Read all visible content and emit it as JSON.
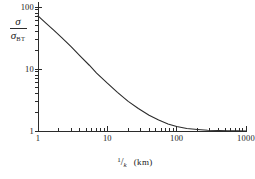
{
  "chart_data": {
    "type": "line",
    "title": "",
    "subtitle": "",
    "xlabel": "1/k  (km)",
    "ylabel": "σ/σ_BT",
    "xscale": "log",
    "yscale": "log",
    "xlim": [
      1,
      1000
    ],
    "ylim": [
      1,
      100
    ],
    "grid": false,
    "legend": null,
    "x_ticks": [
      {
        "value": 1,
        "label": "1",
        "major": true
      },
      {
        "value": 10,
        "label": "10",
        "major": true
      },
      {
        "value": 100,
        "label": "100",
        "major": true
      },
      {
        "value": 1000,
        "label": "1000",
        "major": true
      }
    ],
    "x_minor_ticks": [
      2,
      3,
      4,
      5,
      6,
      7,
      8,
      9,
      20,
      30,
      40,
      50,
      60,
      70,
      80,
      90,
      200,
      300,
      400,
      500,
      600,
      700,
      800,
      900
    ],
    "y_ticks": [
      {
        "value": 1,
        "label": "1",
        "major": true
      },
      {
        "value": 10,
        "label": "10",
        "major": true
      },
      {
        "value": 100,
        "label": "100",
        "major": true
      }
    ],
    "y_minor_ticks": [
      2,
      3,
      4,
      5,
      6,
      7,
      8,
      9,
      20,
      30,
      40,
      50,
      60,
      70,
      80,
      90
    ],
    "series": [
      {
        "name": "sigma ratio",
        "color": "#2b2b2b",
        "x": [
          1,
          1.3,
          1.7,
          2.2,
          3,
          4,
          5.5,
          7,
          10,
          14,
          20,
          28,
          40,
          55,
          75,
          100,
          140,
          200,
          280,
          400,
          550,
          750,
          1000
        ],
        "y": [
          72,
          55,
          42,
          32,
          23,
          16.5,
          11.5,
          8.6,
          5.9,
          4.2,
          3.0,
          2.3,
          1.8,
          1.5,
          1.3,
          1.18,
          1.1,
          1.06,
          1.03,
          1.02,
          1.01,
          1.005,
          1.0
        ]
      }
    ]
  },
  "axis_titles": {
    "y_numerator": "σ",
    "y_denominator_main": "σ",
    "y_denominator_sub": "BT",
    "x_frac_numerator": "1",
    "x_frac_slash": "/",
    "x_frac_denominator": "k",
    "x_unit": "(km)"
  }
}
